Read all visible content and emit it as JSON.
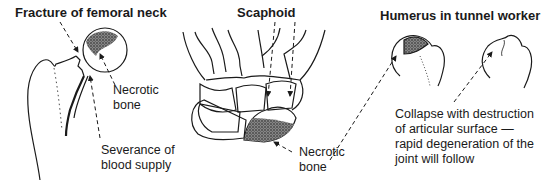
{
  "panels": [
    {
      "title": "Fracture of femoral neck",
      "labels": [
        "Necrotic\nbone",
        "Severance of\nblood supply"
      ]
    },
    {
      "title": "Scaphoid",
      "labels": [
        "Necrotic\nbone"
      ]
    },
    {
      "title": "Humerus in tunnel worker",
      "labels": [
        "Collapse with destruction\nof articular surface —\nrapid degeneration of the\njoint will follow"
      ]
    }
  ]
}
